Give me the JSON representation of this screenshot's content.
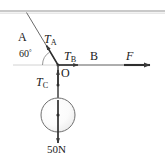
{
  "figure": {
    "type": "free-body-force-diagram",
    "labels": {
      "anchor_point": "A",
      "tension_a": "T",
      "tension_a_sub": "A",
      "angle": "60",
      "angle_unit": "°",
      "tension_b": "T",
      "tension_b_sub": "B",
      "point_b": "B",
      "applied_force": "F",
      "junction_point": "O",
      "tension_c": "T",
      "tension_c_sub": "C",
      "weight": "50N"
    },
    "colors": {
      "line": "#3a3a3a",
      "ceiling": "#c9c9c9",
      "guide": "#bdbdbd",
      "ball_fill": "#f7f7f7",
      "text": "#1a1a1a"
    },
    "geometry": {
      "ceiling_y": 11,
      "junction": [
        58,
        65
      ],
      "ceiling_attach": [
        25,
        12
      ],
      "force_arrow_end": [
        150,
        65
      ],
      "ball_center": [
        58,
        115
      ],
      "ball_radius": 17,
      "weight_arrow_end": [
        58,
        143
      ],
      "angle_degrees": 60
    }
  }
}
